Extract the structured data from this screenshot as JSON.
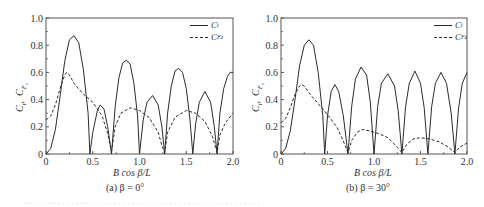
{
  "chart_data": [
    {
      "type": "line",
      "panel": "a",
      "caption": "(a)  β = 0°",
      "xlabel": "B cos β/L",
      "ylabel": "C_t ,  C_Fz",
      "xlim": [
        0,
        2.0
      ],
      "ylim": [
        0,
        1.0
      ],
      "xticks": [
        "0",
        "0.5",
        "1.0",
        "1.5",
        "2.0"
      ],
      "yticks": [
        "0",
        "0.2",
        "0.4",
        "0.6",
        "0.8",
        "1.0"
      ],
      "grid": false,
      "legend_position": "upper right",
      "series": [
        {
          "name": "C_t",
          "style": "solid",
          "x": [
            0,
            0.05,
            0.1,
            0.15,
            0.2,
            0.25,
            0.3,
            0.35,
            0.4,
            0.45,
            0.47,
            0.5,
            0.55,
            0.58,
            0.62,
            0.66,
            0.7,
            0.74,
            0.78,
            0.82,
            0.86,
            0.9,
            0.94,
            0.98,
            1.0,
            1.04,
            1.08,
            1.14,
            1.2,
            1.24,
            1.27,
            1.3,
            1.34,
            1.38,
            1.42,
            1.46,
            1.5,
            1.54,
            1.57,
            1.6,
            1.64,
            1.7,
            1.76,
            1.8,
            1.83,
            1.86,
            1.9,
            1.94,
            1.97,
            2.0
          ],
          "y": [
            0,
            0.04,
            0.18,
            0.42,
            0.68,
            0.84,
            0.87,
            0.82,
            0.62,
            0.3,
            0,
            0.16,
            0.32,
            0.36,
            0.33,
            0.2,
            0,
            0.35,
            0.56,
            0.67,
            0.69,
            0.66,
            0.52,
            0.28,
            0,
            0.25,
            0.38,
            0.43,
            0.36,
            0.2,
            0,
            0.3,
            0.5,
            0.61,
            0.63,
            0.6,
            0.48,
            0.25,
            0,
            0.22,
            0.38,
            0.46,
            0.38,
            0.2,
            0,
            0.3,
            0.48,
            0.57,
            0.6,
            0.6
          ]
        },
        {
          "name": "C_Fz",
          "style": "dashed",
          "x": [
            0,
            0.05,
            0.1,
            0.15,
            0.2,
            0.22,
            0.25,
            0.3,
            0.4,
            0.5,
            0.6,
            0.66,
            0.7,
            0.74,
            0.8,
            0.9,
            1.0,
            1.1,
            1.2,
            1.24,
            1.27,
            1.3,
            1.38,
            1.5,
            1.6,
            1.7,
            1.78,
            1.83,
            1.86,
            1.92,
            2.0
          ],
          "y": [
            0.25,
            0.28,
            0.36,
            0.48,
            0.58,
            0.6,
            0.58,
            0.52,
            0.44,
            0.38,
            0.28,
            0.15,
            0.02,
            0.2,
            0.3,
            0.34,
            0.32,
            0.27,
            0.16,
            0.06,
            0.01,
            0.16,
            0.27,
            0.32,
            0.3,
            0.24,
            0.13,
            0.01,
            0.14,
            0.23,
            0.3
          ]
        }
      ]
    },
    {
      "type": "line",
      "panel": "b",
      "caption": "(b)  β = 30°",
      "xlabel": "B cos β/L",
      "ylabel": "C_t ,  C_Fz",
      "xlim": [
        0,
        2.0
      ],
      "ylim": [
        0,
        1.0
      ],
      "xticks": [
        "0",
        "0.5",
        "1.0",
        "1.5",
        "2.0"
      ],
      "yticks": [
        "0",
        "0.2",
        "0.4",
        "0.6",
        "0.8",
        "1.0"
      ],
      "grid": false,
      "legend_position": "upper right",
      "series": [
        {
          "name": "C_t",
          "style": "solid",
          "x": [
            0,
            0.05,
            0.1,
            0.15,
            0.2,
            0.25,
            0.3,
            0.35,
            0.4,
            0.45,
            0.47,
            0.5,
            0.54,
            0.58,
            0.62,
            0.67,
            0.72,
            0.76,
            0.8,
            0.86,
            0.92,
            0.96,
            1.0,
            1.04,
            1.08,
            1.15,
            1.22,
            1.26,
            1.3,
            1.34,
            1.38,
            1.44,
            1.5,
            1.54,
            1.58,
            1.62,
            1.66,
            1.72,
            1.78,
            1.83,
            1.87,
            1.91,
            1.95,
            2.0
          ],
          "y": [
            0,
            0.04,
            0.17,
            0.4,
            0.65,
            0.8,
            0.84,
            0.8,
            0.6,
            0.28,
            0,
            0.28,
            0.46,
            0.51,
            0.46,
            0.28,
            0,
            0.35,
            0.55,
            0.64,
            0.58,
            0.38,
            0,
            0.35,
            0.52,
            0.59,
            0.5,
            0.32,
            0,
            0.35,
            0.52,
            0.61,
            0.52,
            0.34,
            0,
            0.35,
            0.52,
            0.6,
            0.52,
            0.3,
            0,
            0.34,
            0.52,
            0.6
          ]
        },
        {
          "name": "C_Fz",
          "style": "dashed",
          "x": [
            0,
            0.05,
            0.1,
            0.15,
            0.2,
            0.22,
            0.25,
            0.3,
            0.4,
            0.5,
            0.6,
            0.68,
            0.72,
            0.76,
            0.82,
            0.88,
            0.95,
            1.05,
            1.15,
            1.25,
            1.3,
            1.35,
            1.42,
            1.5,
            1.6,
            1.7,
            1.8,
            1.87,
            1.92,
            2.0
          ],
          "y": [
            0.23,
            0.26,
            0.34,
            0.44,
            0.5,
            0.51,
            0.5,
            0.45,
            0.37,
            0.29,
            0.2,
            0.08,
            0.01,
            0.1,
            0.16,
            0.18,
            0.17,
            0.15,
            0.12,
            0.05,
            0.01,
            0.07,
            0.11,
            0.12,
            0.11,
            0.09,
            0.05,
            0.01,
            0.05,
            0.08
          ]
        }
      ]
    }
  ],
  "legend": {
    "ct_label": "C",
    "ct_sub": "t",
    "cfz_label": "C",
    "cfz_sub": "Fz"
  },
  "colors": {
    "line": "#2b2b2b",
    "axis": "#555555",
    "text": "#333333"
  },
  "footer_text": "· · · · · · · · · · · · · · · · · · · · · · · · · · · · · · · · · · · · · · · · · · · · · · · · · · · · ·"
}
